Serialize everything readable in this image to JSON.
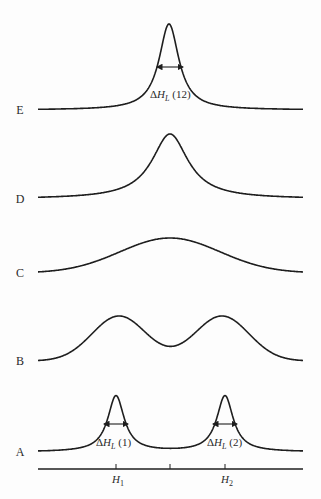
{
  "figure": {
    "stroke_color": "#1e1e1e",
    "background": "#fdfdfd"
  },
  "rows": [
    {
      "label": "E",
      "baseline_y": 110,
      "peaks": [
        {
          "x": 169,
          "height": 86,
          "width": 12
        }
      ],
      "annotation": {
        "text_prefix": "ΔH",
        "subscript": "L",
        "suffix": " (12)",
        "arrow_y": 67,
        "x1": 157,
        "x2": 183,
        "text_x": 150,
        "text_y": 98
      }
    },
    {
      "label": "D",
      "baseline_y": 199,
      "peaks": [
        {
          "x": 170,
          "height": 65,
          "width": 22
        }
      ]
    },
    {
      "label": "C",
      "baseline_y": 273,
      "peaks": [
        {
          "x": 170,
          "height": 35,
          "width": 50
        }
      ],
      "gaussian": true
    },
    {
      "label": "B",
      "baseline_y": 361,
      "peaks": [
        {
          "x": 119,
          "height": 45,
          "width": 27
        },
        {
          "x": 222,
          "height": 45,
          "width": 27
        }
      ],
      "gaussian": true
    },
    {
      "label": "A",
      "baseline_y": 452,
      "peaks": [
        {
          "x": 116,
          "height": 56,
          "width": 10
        },
        {
          "x": 225,
          "height": 56,
          "width": 10
        }
      ],
      "annotations": [
        {
          "text_prefix": "ΔH",
          "subscript": "L",
          "suffix": " (1)",
          "arrow_y": 424,
          "x1": 104,
          "x2": 128,
          "text_x": 96,
          "text_y": 446
        },
        {
          "text_prefix": "ΔH",
          "subscript": "L",
          "suffix": " (2)",
          "arrow_y": 424,
          "x1": 213,
          "x2": 237,
          "text_x": 207,
          "text_y": 446
        }
      ]
    }
  ],
  "axis": {
    "y": 469,
    "x_start": 38,
    "x_end": 303,
    "ticks": [
      {
        "x": 116,
        "label": "H",
        "subscript": "1"
      },
      {
        "x": 170,
        "label": "",
        "subscript": ""
      },
      {
        "x": 225,
        "label": "H",
        "subscript": "2"
      }
    ]
  },
  "curve_range": {
    "x_start": 38,
    "x_end": 303
  },
  "label_x": 20
}
